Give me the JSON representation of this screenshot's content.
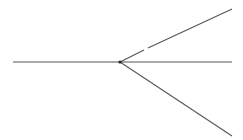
{
  "diagram": {
    "type": "geometry-rays",
    "canvas": {
      "width": 243,
      "height": 140,
      "background": "#ffffff"
    },
    "line_color": "#555555",
    "vertex_color": "#222222",
    "vertex": {
      "x": 120,
      "y": 62
    },
    "rays": [
      {
        "name": "left-ray",
        "x1": 13,
        "y1": 62,
        "x2": 120,
        "y2": 62
      },
      {
        "name": "right-ray",
        "x1": 120,
        "y1": 62,
        "x2": 232,
        "y2": 62
      },
      {
        "name": "upper-ray-inner",
        "x1": 120,
        "y1": 62,
        "x2": 144,
        "y2": 50
      },
      {
        "name": "upper-ray-outer",
        "x1": 148,
        "y1": 48,
        "x2": 232,
        "y2": 9
      },
      {
        "name": "lower-ray",
        "x1": 120,
        "y1": 62,
        "x2": 232,
        "y2": 136
      }
    ]
  }
}
